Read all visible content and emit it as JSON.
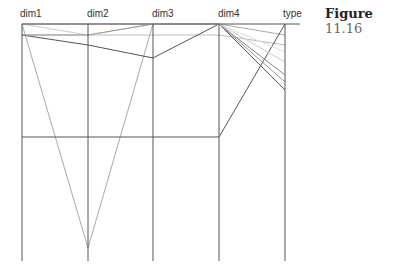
{
  "figure": {
    "label": "Figure",
    "number": "11.16"
  },
  "chart_data": {
    "type": "parallel-coordinates",
    "axes": [
      "dim1",
      "dim2",
      "dim3",
      "dim4",
      "type"
    ],
    "axis_x": [
      22,
      88,
      153,
      219,
      285
    ],
    "axis_top": 24,
    "axis_bottom": 261,
    "polylines": [
      {
        "y": [
          24,
          248,
          24,
          24,
          35
        ],
        "color": "#aaaaaa"
      },
      {
        "y": [
          35,
          35,
          35,
          35,
          45
        ],
        "color": "#bbbbbb"
      },
      {
        "y": [
          35,
          45,
          58,
          24,
          90
        ],
        "color": "#555555"
      },
      {
        "y": [
          137,
          137,
          137,
          137,
          24
        ],
        "color": "#555555"
      },
      {
        "y": [
          24,
          35,
          24,
          24,
          62
        ],
        "color": "#cccccc"
      },
      {
        "y": [
          24,
          24,
          24,
          24,
          75
        ],
        "color": "#888888"
      },
      {
        "y": [
          35,
          35,
          24,
          24,
          82
        ],
        "color": "#999999"
      },
      {
        "y": [
          24,
          24,
          24,
          24,
          52
        ],
        "color": "#dddddd"
      }
    ]
  }
}
